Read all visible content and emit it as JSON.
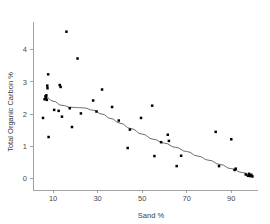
{
  "chart_data": {
    "type": "scatter",
    "title": "",
    "xlabel": "Sand %",
    "ylabel": "Total Organic Carbon %",
    "xlim": [
      1,
      102
    ],
    "ylim": [
      -0.35,
      4.85
    ],
    "xticks": [
      10,
      30,
      50,
      70,
      90
    ],
    "yticks": [
      0,
      1,
      2,
      3,
      4
    ],
    "xticklabels": [
      "10",
      "30",
      "50",
      "70",
      "90"
    ],
    "yticklabels": [
      "0",
      "1",
      "2",
      "3",
      "4"
    ],
    "grid": false,
    "legend": null,
    "marker": "filled-square",
    "marker_color": "#000000",
    "points": [
      {
        "x": 5.5,
        "y": 1.88
      },
      {
        "x": 6.2,
        "y": 2.46
      },
      {
        "x": 6.6,
        "y": 2.55
      },
      {
        "x": 6.8,
        "y": 2.5
      },
      {
        "x": 7.0,
        "y": 2.58
      },
      {
        "x": 7.2,
        "y": 2.44
      },
      {
        "x": 7.4,
        "y": 2.88
      },
      {
        "x": 7.5,
        "y": 2.8
      },
      {
        "x": 7.8,
        "y": 3.23
      },
      {
        "x": 8.0,
        "y": 1.29
      },
      {
        "x": 10.5,
        "y": 2.13
      },
      {
        "x": 12.5,
        "y": 2.1
      },
      {
        "x": 13.0,
        "y": 2.9
      },
      {
        "x": 13.4,
        "y": 2.84
      },
      {
        "x": 14.0,
        "y": 1.92
      },
      {
        "x": 16.0,
        "y": 4.55
      },
      {
        "x": 17.5,
        "y": 2.18
      },
      {
        "x": 18.5,
        "y": 1.6
      },
      {
        "x": 21.0,
        "y": 3.72
      },
      {
        "x": 22.5,
        "y": 2.02
      },
      {
        "x": 28.0,
        "y": 2.42
      },
      {
        "x": 29.5,
        "y": 2.08
      },
      {
        "x": 32.0,
        "y": 2.76
      },
      {
        "x": 36.5,
        "y": 2.22
      },
      {
        "x": 39.5,
        "y": 1.8
      },
      {
        "x": 43.5,
        "y": 0.95
      },
      {
        "x": 44.5,
        "y": 1.52
      },
      {
        "x": 49.5,
        "y": 1.88
      },
      {
        "x": 54.5,
        "y": 2.26
      },
      {
        "x": 55.5,
        "y": 0.7
      },
      {
        "x": 58.5,
        "y": 1.13
      },
      {
        "x": 61.5,
        "y": 1.36
      },
      {
        "x": 62.0,
        "y": 1.17
      },
      {
        "x": 65.5,
        "y": 0.39
      },
      {
        "x": 67.5,
        "y": 0.71
      },
      {
        "x": 83.0,
        "y": 1.45
      },
      {
        "x": 84.5,
        "y": 0.39
      },
      {
        "x": 90.0,
        "y": 1.22
      },
      {
        "x": 91.5,
        "y": 0.27
      },
      {
        "x": 92.0,
        "y": 0.31
      },
      {
        "x": 96.5,
        "y": 0.13
      },
      {
        "x": 97.5,
        "y": 0.09
      },
      {
        "x": 98.0,
        "y": 0.15
      },
      {
        "x": 98.5,
        "y": 0.08
      },
      {
        "x": 99.0,
        "y": 0.12
      },
      {
        "x": 99.5,
        "y": 0.07
      }
    ],
    "trend": {
      "name": "loess-smoother",
      "color": "#5a5a5a",
      "points": [
        {
          "x": 6.5,
          "y": 2.55
        },
        {
          "x": 10.0,
          "y": 2.4
        },
        {
          "x": 14.0,
          "y": 2.27
        },
        {
          "x": 18.0,
          "y": 2.21
        },
        {
          "x": 21.0,
          "y": 2.2
        },
        {
          "x": 24.0,
          "y": 2.19
        },
        {
          "x": 28.0,
          "y": 2.12
        },
        {
          "x": 32.0,
          "y": 2.0
        },
        {
          "x": 36.0,
          "y": 1.86
        },
        {
          "x": 40.0,
          "y": 1.72
        },
        {
          "x": 45.0,
          "y": 1.55
        },
        {
          "x": 50.0,
          "y": 1.38
        },
        {
          "x": 55.0,
          "y": 1.22
        },
        {
          "x": 60.0,
          "y": 1.1
        },
        {
          "x": 65.0,
          "y": 0.97
        },
        {
          "x": 70.0,
          "y": 0.84
        },
        {
          "x": 75.0,
          "y": 0.7
        },
        {
          "x": 80.0,
          "y": 0.57
        },
        {
          "x": 85.0,
          "y": 0.44
        },
        {
          "x": 90.0,
          "y": 0.31
        },
        {
          "x": 95.0,
          "y": 0.19
        },
        {
          "x": 99.5,
          "y": 0.09
        }
      ]
    }
  }
}
